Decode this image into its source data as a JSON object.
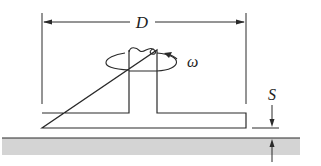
{
  "diagram": {
    "type": "rotating disk above stationary surface",
    "labels": {
      "diameter": "D",
      "angular_velocity": "ω",
      "gap": "S"
    },
    "colors": {
      "line": "#2a2a2a",
      "ground_fill": "#d4d4d4",
      "background": "#ffffff"
    }
  }
}
